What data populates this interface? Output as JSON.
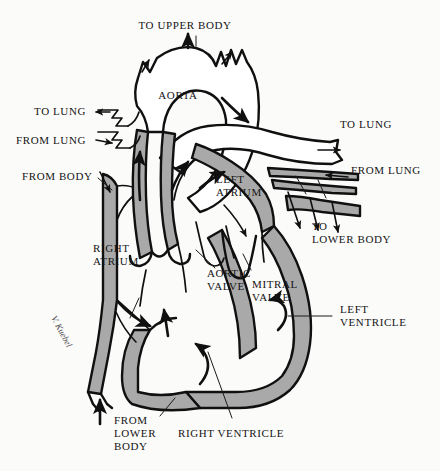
{
  "figure": {
    "type": "anatomical-diagram",
    "width": 440,
    "height": 471,
    "background_color": "#fbfbfa",
    "ink_color": "#101010",
    "muscle_fill_color": "#a9a9a9",
    "chamber_fill_color": "#ffffff",
    "signature": "V. Kuebel"
  },
  "labels": {
    "to_upper_body": "TO UPPER BODY",
    "aorta": "AORTA",
    "to_lung_left": "TO LUNG",
    "from_lung_left": "FROM LUNG",
    "from_body": "FROM BODY",
    "to_lung_right": "TO LUNG",
    "from_lung_right": "FROM LUNG",
    "to_lower_body": "TO\nLOWER BODY",
    "left_atrium": "LEFT\nATRIUM",
    "right_atrium": "RIGHT\nATRIUM",
    "aortic_valve": "AORTIC\nVALVE",
    "mitral_valve": "MITRAL\nVALVE",
    "left_ventricle": "LEFT\nVENTRICLE",
    "right_ventricle": "RIGHT VENTRICLE",
    "from_lower_body": "FROM\nLOWER\nBODY"
  },
  "structures": [
    {
      "name": "aorta",
      "label": "AORTA",
      "kind": "great-vessel"
    },
    {
      "name": "aortic-arch-branches",
      "label": "TO UPPER BODY",
      "kind": "branch-vessels"
    },
    {
      "name": "pulmonary-artery",
      "label": "TO LUNG",
      "kind": "great-vessel"
    },
    {
      "name": "pulmonary-veins",
      "label": "FROM LUNG",
      "kind": "great-vessel"
    },
    {
      "name": "superior-vena-cava",
      "label": "FROM BODY",
      "kind": "great-vessel"
    },
    {
      "name": "inferior-vena-cava",
      "label": "FROM LOWER BODY",
      "kind": "great-vessel"
    },
    {
      "name": "descending-aorta",
      "label": "TO LOWER BODY",
      "kind": "great-vessel"
    },
    {
      "name": "right-atrium",
      "label": "RIGHT ATRIUM",
      "kind": "chamber"
    },
    {
      "name": "left-atrium",
      "label": "LEFT ATRIUM",
      "kind": "chamber"
    },
    {
      "name": "right-ventricle",
      "label": "RIGHT VENTRICLE",
      "kind": "chamber"
    },
    {
      "name": "left-ventricle",
      "label": "LEFT VENTRICLE",
      "kind": "chamber"
    },
    {
      "name": "aortic-valve",
      "label": "AORTIC VALVE",
      "kind": "valve"
    },
    {
      "name": "mitral-valve",
      "label": "MITRAL VALVE",
      "kind": "valve"
    }
  ],
  "flow_arrows": [
    {
      "name": "flow-into-right-atrium-from-body",
      "direction": "down-right"
    },
    {
      "name": "flow-into-right-atrium-lower",
      "direction": "right"
    },
    {
      "name": "flow-up-inferior-vena-cava",
      "direction": "up"
    },
    {
      "name": "flow-right-ventricle-swirl",
      "direction": "counter-clockwise"
    },
    {
      "name": "flow-right-ventricle-to-pulmonary",
      "direction": "up"
    },
    {
      "name": "flow-pulmonary-artery-to-lung",
      "direction": "right"
    },
    {
      "name": "flow-into-left-atrium",
      "direction": "down"
    },
    {
      "name": "flow-left-ventricle-swirl",
      "direction": "counter-clockwise"
    },
    {
      "name": "flow-left-ventricle-to-aorta",
      "direction": "up"
    },
    {
      "name": "flow-aortic-arch",
      "direction": "right"
    },
    {
      "name": "flow-to-upper-body",
      "direction": "up"
    },
    {
      "name": "flow-to-lower-body",
      "direction": "down"
    },
    {
      "name": "flow-to-lung-left-upper",
      "direction": "left"
    },
    {
      "name": "flow-from-lung-left-lower",
      "direction": "right"
    },
    {
      "name": "flow-from-lung-right",
      "direction": "left"
    }
  ]
}
